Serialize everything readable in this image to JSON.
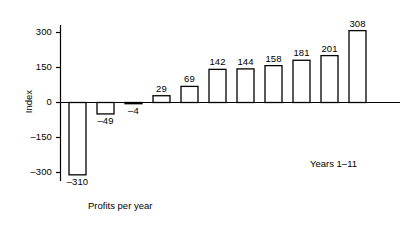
{
  "chart_data": {
    "type": "bar",
    "title": "",
    "subtitle": "",
    "xlabel": "Profits per year",
    "ylabel": "Index",
    "annotation": "Years 1–11",
    "categories": [
      "1",
      "2",
      "3",
      "4",
      "5",
      "6",
      "7",
      "8",
      "9",
      "10",
      "11"
    ],
    "values": [
      -310,
      -49,
      -4,
      29,
      69,
      142,
      144,
      158,
      181,
      201,
      308
    ],
    "value_labels": [
      "–310",
      "–49",
      "–4",
      "29",
      "69",
      "142",
      "144",
      "158",
      "181",
      "201",
      "308"
    ],
    "ylim": [
      -360,
      360
    ],
    "yticks": [
      300,
      150,
      0,
      -150,
      -300
    ],
    "ytick_labels": [
      "300",
      "150",
      "0",
      "–150",
      "–300"
    ],
    "grid": false,
    "legend": null,
    "bar_fill": "#ffffff",
    "bar_stroke": "#000000",
    "axis_color": "#000000",
    "sorted": "ascending"
  },
  "figure": {
    "background": "#ffffff",
    "xaxis_label_text": "Profits per year",
    "yaxis_label_text": "Index",
    "years_note": "Years 1–11"
  }
}
